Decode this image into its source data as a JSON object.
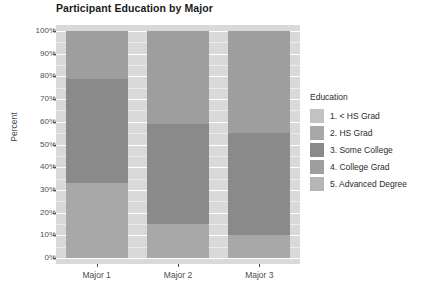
{
  "chart_data": {
    "type": "bar",
    "subtype": "stacked-percent",
    "title": "Participant Education by Major",
    "xlabel": "",
    "ylabel": "Percent",
    "categories": [
      "Major 1",
      "Major 2",
      "Major 3"
    ],
    "ylim": [
      0,
      100
    ],
    "ytick_labels": [
      "0%",
      "10%",
      "20%",
      "30%",
      "40%",
      "50%",
      "60%",
      "70%",
      "80%",
      "90%",
      "100%"
    ],
    "ytick_values": [
      0,
      10,
      20,
      30,
      40,
      50,
      60,
      70,
      80,
      90,
      100
    ],
    "grid": true,
    "grid_color": "#ffffff",
    "panel_background": "#d9d9d9",
    "legend_position": "right",
    "legend_title": "Education",
    "series": [
      {
        "name": "1. < HS Grad",
        "color": "#c2c2c2",
        "values": [
          0,
          0,
          0
        ]
      },
      {
        "name": "2. HS Grad",
        "color": "#a8a8a8",
        "values": [
          33,
          15,
          10
        ]
      },
      {
        "name": "3. Some College",
        "color": "#8a8a8a",
        "values": [
          46,
          44,
          45
        ]
      },
      {
        "name": "4. College Grad",
        "color": "#9e9e9e",
        "values": [
          21,
          41,
          45
        ]
      },
      {
        "name": "5. Advanced Degree",
        "color": "#b5b5b5",
        "values": [
          0,
          0,
          0
        ]
      }
    ]
  },
  "chart": {
    "title": "Participant Education by Major",
    "ylabel": "Percent"
  },
  "legend": {
    "title": "Education",
    "items": [
      {
        "label": "1. < HS Grad",
        "color": "#c2c2c2"
      },
      {
        "label": "2. HS Grad",
        "color": "#a8a8a8"
      },
      {
        "label": "3. Some College",
        "color": "#8a8a8a"
      },
      {
        "label": "4. College Grad",
        "color": "#9e9e9e"
      },
      {
        "label": "5. Advanced Degree",
        "color": "#b5b5b5"
      }
    ]
  }
}
